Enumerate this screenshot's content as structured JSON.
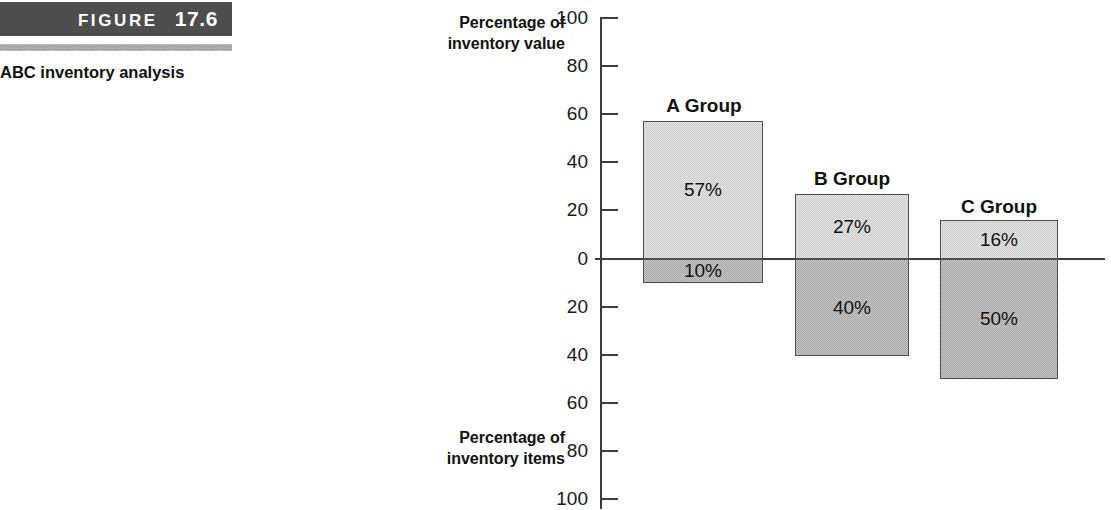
{
  "figure": {
    "badge_word": "FIGURE",
    "badge_number": "17.6",
    "caption": "ABC inventory analysis"
  },
  "chart_data": {
    "type": "bar",
    "title": "ABC inventory analysis",
    "orientation": "vertical-diverging",
    "categories": [
      "A Group",
      "B Group",
      "C Group"
    ],
    "upper_axis_label": "Percentage of inventory value",
    "lower_axis_label": "Percentage of inventory items",
    "xlabel": "",
    "ylabel": "Percentage of inventory value",
    "ylim": [
      -100,
      100
    ],
    "grid": false,
    "legend": "none",
    "tick_labels_upper": [
      "100",
      "80",
      "60",
      "40",
      "20",
      "0"
    ],
    "tick_labels_lower": [
      "20",
      "40",
      "60",
      "80",
      "100"
    ],
    "series": [
      {
        "name": "Percentage of inventory value",
        "direction": "up",
        "values": [
          57,
          27,
          16
        ],
        "data_labels": [
          "57%",
          "27%",
          "16%"
        ],
        "color": "#c9c9c9"
      },
      {
        "name": "Percentage of inventory items",
        "direction": "down",
        "values": [
          10,
          40,
          50
        ],
        "data_labels": [
          "10%",
          "40%",
          "50%"
        ],
        "color": "#a3a3a3"
      }
    ]
  },
  "ticks": [
    {
      "label": "100",
      "top": 8
    },
    {
      "label": "80",
      "top": 56
    },
    {
      "label": "60",
      "top": 104
    },
    {
      "label": "40",
      "top": 152
    },
    {
      "label": "20",
      "top": 200
    },
    {
      "label": "0",
      "top": 249
    },
    {
      "label": "20",
      "top": 297
    },
    {
      "label": "40",
      "top": 345
    },
    {
      "label": "60",
      "top": 393
    },
    {
      "label": "80",
      "top": 441
    },
    {
      "label": "100",
      "top": 489
    }
  ],
  "groups": [
    {
      "label": "A Group",
      "label_left": 645,
      "label_top": 95,
      "label_width": 118,
      "left": 643,
      "width": 120,
      "upper_top": 121,
      "upper_height": 138,
      "lower_top": 259,
      "lower_height": 24,
      "upper_value": "57%",
      "lower_value": "10%"
    },
    {
      "label": "B Group",
      "label_left": 795,
      "label_top": 168,
      "label_width": 114,
      "left": 795,
      "width": 114,
      "upper_top": 194,
      "upper_height": 65,
      "lower_top": 259,
      "lower_height": 97,
      "upper_value": "27%",
      "lower_value": "40%"
    },
    {
      "label": "C Group",
      "label_left": 940,
      "label_top": 196,
      "label_width": 118,
      "left": 940,
      "width": 118,
      "upper_top": 220,
      "upper_height": 39,
      "lower_top": 259,
      "lower_height": 120,
      "upper_value": "16%",
      "lower_value": "50%"
    }
  ]
}
